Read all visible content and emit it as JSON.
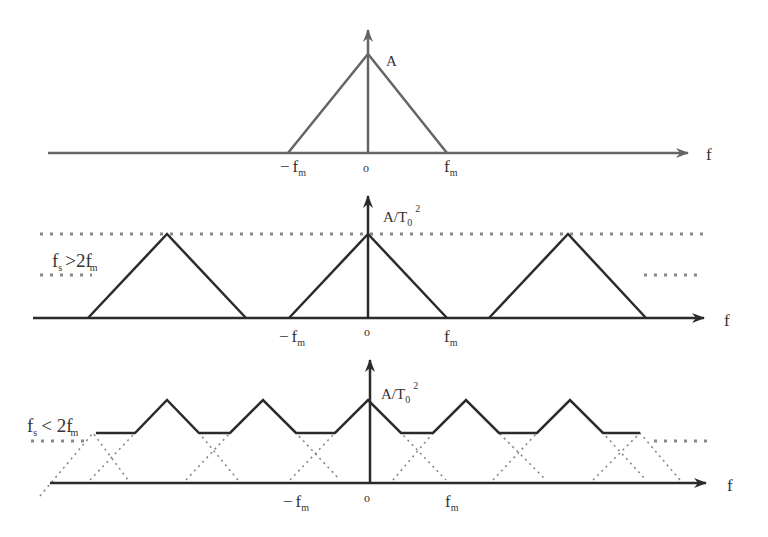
{
  "colors": {
    "top_panel_stroke": "#666666",
    "spectrum_stroke": "#2b2b2b",
    "dotted_stroke": "#888888",
    "background": "#ffffff"
  },
  "panels": [
    {
      "id": "original-spectrum",
      "axis_label": "f",
      "peak_label": "A",
      "origin_label": "o",
      "neg_fm": {
        "sign": "−",
        "f": "f",
        "sub": "m"
      },
      "pos_fm": {
        "f": "f",
        "sub": "m"
      }
    },
    {
      "id": "oversampled-spectrum",
      "axis_label": "f",
      "peak_label": {
        "base": "A/T",
        "sub": "0",
        "sup": "2"
      },
      "origin_label": "o",
      "condition": {
        "f": "f",
        "s_sub": "s",
        "op": ">2",
        "f2": "f",
        "m_sub": "m"
      },
      "neg_fm": {
        "sign": "−",
        "f": "f",
        "sub": "m"
      },
      "pos_fm": {
        "f": "f",
        "sub": "m"
      }
    },
    {
      "id": "undersampled-spectrum",
      "axis_label": "f",
      "peak_label": {
        "base": "A/T",
        "sub": "0",
        "sup": "2"
      },
      "origin_label": "o",
      "condition": {
        "f": "f",
        "s_sub": "s",
        "op": "< 2",
        "f2": "f",
        "m_sub": "m"
      },
      "neg_fm": {
        "sign": "−",
        "f": "f",
        "sub": "m"
      },
      "pos_fm": {
        "f": "f",
        "sub": "m"
      }
    }
  ]
}
